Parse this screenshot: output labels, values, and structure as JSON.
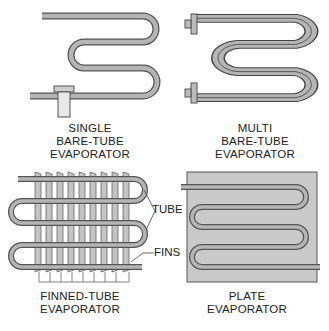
{
  "figure": {
    "panels": [
      {
        "id": "single",
        "caption_lines": [
          "SINGLE",
          "BARE-TUBE",
          "EVAPORATOR"
        ]
      },
      {
        "id": "multi",
        "caption_lines": [
          "MULTI",
          "BARE-TUBE",
          "EVAPORATOR"
        ]
      },
      {
        "id": "finned",
        "caption_lines": [
          "FINNED-TUBE",
          "EVAPORATOR"
        ],
        "callouts": [
          "TUBE",
          "FINS"
        ]
      },
      {
        "id": "plate",
        "caption_lines": [
          "PLATE",
          "EVAPORATOR"
        ]
      }
    ],
    "colors": {
      "tube_fill": "#b5b5b5",
      "tube_stroke": "#555555",
      "fin_fill": "#c4c4c4",
      "plate_fill": "#c9c9c9",
      "text": "#222222"
    }
  }
}
